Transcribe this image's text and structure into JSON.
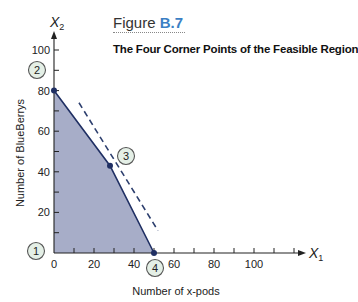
{
  "figure": {
    "label_prefix": "Figure",
    "label_number": "B.7",
    "title": "The Four Corner Points of the Feasible Region"
  },
  "chart_data": {
    "type": "area",
    "title": "The Four Corner Points of the Feasible Region",
    "xlabel": "Number of x-pods",
    "ylabel": "Number of BlueBerrys",
    "x_axis_symbol": "X1",
    "y_axis_symbol": "X2",
    "xlim": [
      0,
      120
    ],
    "ylim": [
      0,
      100
    ],
    "x_ticks": [
      0,
      20,
      40,
      60,
      80,
      100
    ],
    "y_ticks": [
      20,
      40,
      60,
      80,
      100
    ],
    "grid": false,
    "feasible_region": [
      [
        0,
        0
      ],
      [
        0,
        80
      ],
      [
        28,
        43
      ],
      [
        50,
        0
      ]
    ],
    "corner_points": [
      {
        "label": "1",
        "x": 0,
        "y": 0
      },
      {
        "label": "2",
        "x": 0,
        "y": 80
      },
      {
        "label": "3",
        "x": 28,
        "y": 43
      },
      {
        "label": "4",
        "x": 50,
        "y": 0
      }
    ],
    "iso_profit_line": {
      "style": "dashed",
      "from": [
        12.5,
        74
      ],
      "to": [
        52,
        11
      ]
    },
    "colors": {
      "region_fill": "#a7adc8",
      "boundary": "#1f2f63",
      "callout_fill": "#e4efe6",
      "callout_stroke": "#555555",
      "figure_number": "#3b7fc4"
    }
  }
}
